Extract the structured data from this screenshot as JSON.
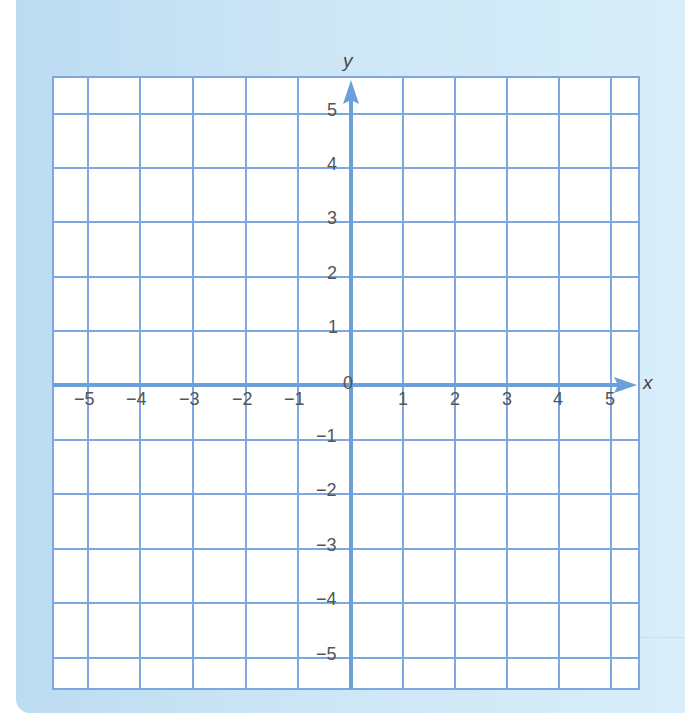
{
  "diagram": {
    "type": "coordinate-plane",
    "x_axis": {
      "label": "x",
      "min": -5,
      "max": 5,
      "ticks": [
        "−5",
        "−4",
        "−3",
        "−2",
        "−1",
        "1",
        "2",
        "3",
        "4",
        "5"
      ]
    },
    "y_axis": {
      "label": "y",
      "min": -5,
      "max": 5,
      "ticks": [
        "5",
        "4",
        "3",
        "2",
        "1",
        "−1",
        "−2",
        "−3",
        "−4",
        "−5"
      ]
    },
    "origin_label": "0",
    "grid": true,
    "colors": {
      "background": "#cde6f6",
      "grid_line": "#7ea6e0",
      "axis_line": "#6a9fdc",
      "label_text": "#555555"
    }
  },
  "labels": {
    "x_name": "x",
    "y_name": "y",
    "origin": "0",
    "x_neg5": "−5",
    "x_neg4": "−4",
    "x_neg3": "−3",
    "x_neg2": "−2",
    "x_neg1": "−1",
    "x_1": "1",
    "x_2": "2",
    "x_3": "3",
    "x_4": "4",
    "x_5": "5",
    "y_5": "5",
    "y_4": "4",
    "y_3": "3",
    "y_2": "2",
    "y_1": "1",
    "y_neg1": "−1",
    "y_neg2": "−2",
    "y_neg3": "−3",
    "y_neg4": "−4",
    "y_neg5": "−5"
  }
}
